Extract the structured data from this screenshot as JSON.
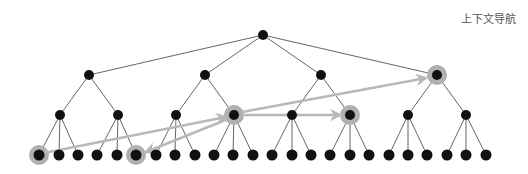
{
  "title": "上下文导航",
  "colors": {
    "node": "#111111",
    "edge": "#666666",
    "highlight_ring": "#b0b0b0",
    "arrow": "#b8b8b8"
  },
  "tree": {
    "root": {
      "x": 263,
      "y": 35
    },
    "level1": [
      {
        "x": 89,
        "y": 75
      },
      {
        "x": 205,
        "y": 75
      },
      {
        "x": 321,
        "y": 75
      },
      {
        "x": 437,
        "y": 75
      }
    ],
    "level2_y": 115,
    "level2_x": [
      60,
      118,
      176,
      234,
      292,
      350,
      408,
      466
    ],
    "leaf_y": 155,
    "leaf_x": [
      39,
      59,
      78,
      97,
      117,
      136,
      156,
      175,
      195,
      214,
      233,
      253,
      272,
      292,
      311,
      330,
      350,
      369,
      389,
      408,
      427,
      447,
      466,
      486
    ]
  },
  "highlighted": [
    {
      "level": "leaf",
      "index": 0
    },
    {
      "level": "leaf",
      "index": 5
    },
    {
      "level": "level2",
      "index": 3
    },
    {
      "level": "level2",
      "index": 5
    },
    {
      "level": "level1",
      "index": 3
    }
  ],
  "arrows": [
    {
      "from": [
        44,
        153
      ],
      "to": [
        226,
        117
      ]
    },
    {
      "from": [
        228,
        119
      ],
      "to": [
        146,
        152
      ]
    },
    {
      "from": [
        242,
        115
      ],
      "to": [
        340,
        115
      ]
    },
    {
      "from": [
        242,
        112
      ],
      "to": [
        426,
        78
      ]
    }
  ]
}
